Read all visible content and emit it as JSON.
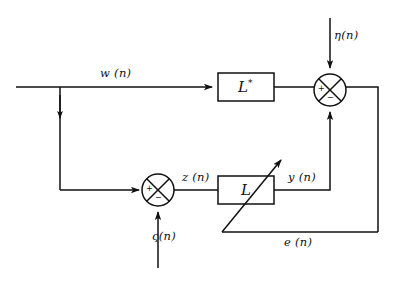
{
  "figure": {
    "kind": "signal-flow-block-diagram",
    "background_color": "#ffffff",
    "line_color": "#111111"
  },
  "blocks": [
    {
      "id": "upper-filter",
      "label": "L",
      "superscript": "*",
      "x": 218,
      "y": 73,
      "width": 56,
      "height": 28
    },
    {
      "id": "lower-filter",
      "label": "L",
      "superscript": "",
      "x": 218,
      "y": 176,
      "width": 56,
      "height": 28
    }
  ],
  "summing_junctions": [
    {
      "id": "upper-summer",
      "cx": 330,
      "cy": 90,
      "r": 16,
      "plus_sign": "+",
      "minus_sign": "−",
      "plus_quadrant": "left",
      "minus_quadrant": "bottom"
    },
    {
      "id": "lower-summer",
      "cx": 158,
      "cy": 190,
      "r": 16,
      "plus_sign": "+",
      "minus_sign": "−",
      "plus_quadrant": "left",
      "minus_quadrant": "bottom"
    }
  ],
  "signal_labels": [
    {
      "id": "w-label",
      "text": "w (n)",
      "x": 100,
      "y": 66
    },
    {
      "id": "eta-label",
      "text": "η(n)",
      "x": 334,
      "y": 28
    },
    {
      "id": "z-label",
      "text": "z (n)",
      "x": 182,
      "y": 170
    },
    {
      "id": "y-label",
      "text": "y (n)",
      "x": 288,
      "y": 170
    },
    {
      "id": "zeta-label",
      "text": "ς(n)",
      "x": 152,
      "y": 229
    },
    {
      "id": "e-label",
      "text": "e (n)",
      "x": 284,
      "y": 225
    }
  ],
  "connections": [
    {
      "id": "w-input-line",
      "from": "left-edge",
      "to": "upper-filter-input"
    },
    {
      "id": "w-branch-down",
      "from": "w-branch-point",
      "to": "lower-summer-input"
    },
    {
      "id": "upper-filter-output",
      "from": "upper-filter",
      "to": "upper-summer"
    },
    {
      "id": "eta-input",
      "from": "top-edge",
      "to": "upper-summer"
    },
    {
      "id": "y-feedback-up",
      "from": "lower-filter",
      "to": "upper-summer"
    },
    {
      "id": "zeta-input",
      "from": "bottom-edge",
      "to": "lower-summer"
    },
    {
      "id": "z-line",
      "from": "lower-summer",
      "to": "lower-filter"
    },
    {
      "id": "error-return",
      "from": "upper-summer",
      "to": "e-line"
    },
    {
      "id": "adaptation-arrow",
      "from": "e-line",
      "to": "lower-filter"
    }
  ]
}
